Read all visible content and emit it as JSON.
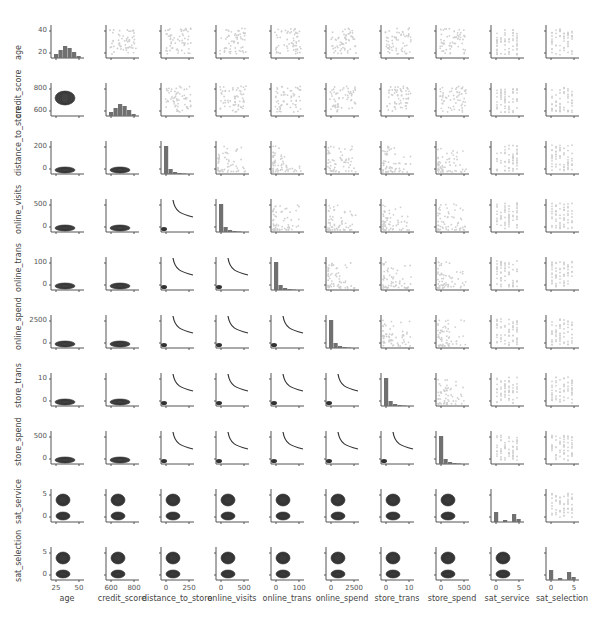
{
  "chart_data": {
    "type": "scatter",
    "title": "",
    "layout": "pairplot",
    "grid": false,
    "variables": [
      "age",
      "credit_score",
      "distance_to_store",
      "online_visits",
      "online_trans",
      "online_spend",
      "store_trans",
      "store_spend",
      "sat_service",
      "sat_selection"
    ],
    "diagonal": "histogram",
    "upper_triangle": "scatter (light gray points)",
    "lower_triangle": "kde contours / fitted curves (dark)",
    "y_ticks": {
      "age": [
        "20",
        "40"
      ],
      "credit_score": [
        "600",
        "800"
      ],
      "distance_to_store": [
        "0",
        "200"
      ],
      "online_visits": [
        "0",
        "500"
      ],
      "online_trans": [
        "0",
        "100"
      ],
      "online_spend": [
        "0",
        "2500"
      ],
      "store_trans": [
        "0",
        "10"
      ],
      "store_spend": [
        "0",
        "500"
      ],
      "sat_service": [
        "0",
        "5"
      ],
      "sat_selection": [
        "0",
        "5"
      ]
    },
    "x_ticks": {
      "age": [
        "25",
        "50"
      ],
      "credit_score": [
        "600",
        "800"
      ],
      "distance_to_store": [
        "0",
        "250"
      ],
      "online_visits": [
        "0",
        "500"
      ],
      "online_trans": [
        "0",
        "100"
      ],
      "online_spend": [
        "0",
        "2500"
      ],
      "store_trans": [
        "0",
        "10"
      ],
      "store_spend": [
        "0",
        "500"
      ],
      "sat_service": [
        "0",
        "5"
      ],
      "sat_selection": [
        "0",
        "5"
      ]
    },
    "ranges": {
      "age": [
        15,
        55
      ],
      "credit_score": [
        550,
        900
      ],
      "distance_to_store": [
        0,
        300
      ],
      "online_visits": [
        0,
        650
      ],
      "online_trans": [
        0,
        170
      ],
      "online_spend": [
        0,
        4000
      ],
      "store_trans": [
        0,
        14
      ],
      "store_spend": [
        0,
        700
      ],
      "sat_service": [
        -2,
        6
      ],
      "sat_selection": [
        -2,
        6
      ]
    }
  },
  "footer": {
    "text": ""
  }
}
